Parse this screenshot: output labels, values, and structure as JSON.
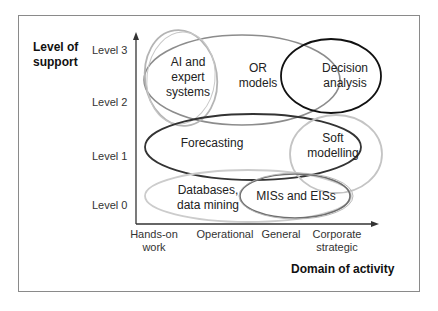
{
  "y_axis": {
    "title_line1": "Level of",
    "title_line2": "support",
    "ticks": [
      "Level 3",
      "Level 2",
      "Level 1",
      "Level 0"
    ]
  },
  "x_axis": {
    "title": "Domain of activity",
    "ticks": [
      {
        "line1": "Hands-on",
        "line2": "work"
      },
      {
        "line1": "Operational",
        "line2": ""
      },
      {
        "line1": "General",
        "line2": ""
      },
      {
        "line1": "Corporate",
        "line2": "strategic"
      }
    ]
  },
  "regions": [
    {
      "id": "ai",
      "line1": "AI and",
      "line2": "expert",
      "line3": "systems",
      "stroke": "#b0b0b0"
    },
    {
      "id": "or",
      "line1": "OR",
      "line2": "models",
      "stroke": "#8c8c8c"
    },
    {
      "id": "decision",
      "line1": "Decision",
      "line2": "analysis",
      "stroke": "#111111"
    },
    {
      "id": "forecasting",
      "line1": "Forecasting",
      "stroke": "#333333"
    },
    {
      "id": "soft",
      "line1": "Soft",
      "line2": "modelling",
      "stroke": "#c0c0c0"
    },
    {
      "id": "databases",
      "line1": "Databases,",
      "line2": "data mining",
      "stroke": "#c8c8c8"
    },
    {
      "id": "mis",
      "line1": "MISs and EISs",
      "stroke": "#707070"
    }
  ]
}
